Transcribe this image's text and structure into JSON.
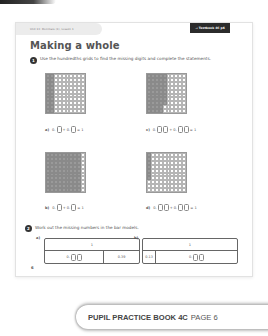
{
  "header": {
    "unit_label": "Unit 13: Decimals (1), Lesson 1",
    "textbook_ref": "→ Textbook 4C p6"
  },
  "title": "Making a whole",
  "question1": {
    "number": "1",
    "instruction": "Use the hundredths grids to find the missing digits and complete the statements.",
    "parts": [
      {
        "label": "a)",
        "shaded_hundredths": 20,
        "statement": [
          "0.",
          "box",
          "+ 0.",
          "box",
          "= 1"
        ]
      },
      {
        "label": "c)",
        "shaded_hundredths": 48,
        "statement": [
          "0.",
          "box",
          "box",
          "+ 0.",
          "box",
          "box",
          "= 1"
        ]
      },
      {
        "label": "b)",
        "shaded_hundredths": 90,
        "statement": [
          "0.",
          "box",
          "+ 0.",
          "box",
          "= 1"
        ]
      },
      {
        "label": "d)",
        "shaded_hundredths": 7,
        "statement": [
          "0.",
          "box",
          "box",
          "+ 0.",
          "box",
          "box",
          "= 1"
        ]
      }
    ]
  },
  "question2": {
    "number": "2",
    "instruction": "Work out the missing numbers in the bar models.",
    "bars": [
      {
        "label": "a)",
        "whole": "1",
        "left": "0.",
        "right": "0.39"
      },
      {
        "label": "b)",
        "whole": "1",
        "left": "0.13",
        "right": "0."
      }
    ]
  },
  "page_number": "6",
  "banner": {
    "book": "PUPIL PRACTICE BOOK 4C",
    "page": "PAGE 6"
  },
  "colors": {
    "shaded_cell": "#9a9a9a",
    "badge_bg": "#2b2b2b"
  }
}
